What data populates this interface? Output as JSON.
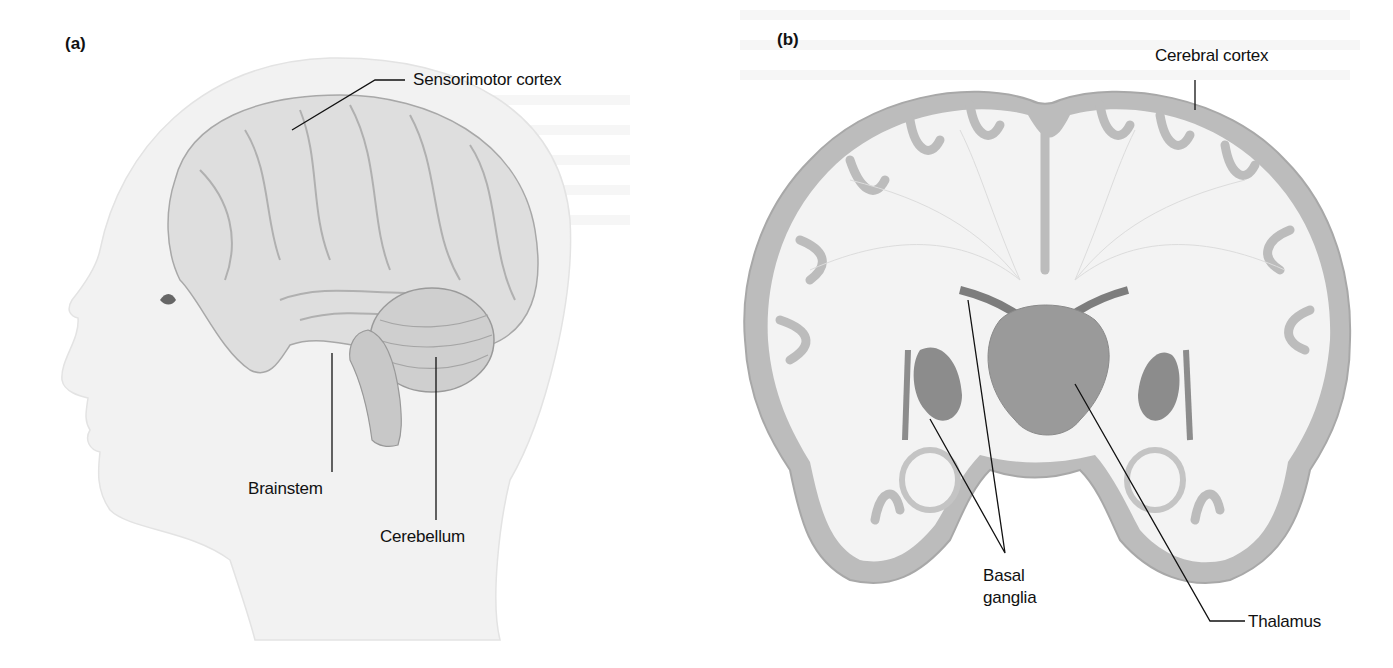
{
  "figure": {
    "panels": [
      {
        "id": "a",
        "panel_label": "(a)",
        "view": "Lateral view of head showing brain",
        "labels": {
          "sensorimotor_cortex": "Sensorimotor cortex",
          "brainstem": "Brainstem",
          "cerebellum": "Cerebellum"
        }
      },
      {
        "id": "b",
        "panel_label": "(b)",
        "view": "Coronal section of brain",
        "labels": {
          "cerebral_cortex": "Cerebral cortex",
          "basal_ganglia_line1": "Basal",
          "basal_ganglia_line2": "ganglia",
          "thalamus": "Thalamus"
        }
      }
    ],
    "colors": {
      "head_fill": "#f2f2f2",
      "brain_fill": "#d9d9d9",
      "cortex_gray": "#b8b8b8",
      "white_matter": "#f4f4f4",
      "deep_nuclei": "#8c8c8c",
      "leader_line": "#111111"
    }
  }
}
